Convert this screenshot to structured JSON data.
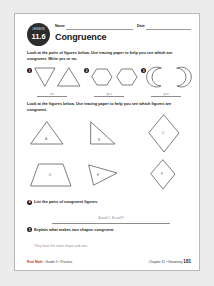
{
  "header": {
    "lesson_word": "LESSON",
    "lesson_number": "11.6",
    "name_label": "Name",
    "date_label": "Date",
    "title": "Congruence"
  },
  "instruction_1": {
    "lead": "Look",
    "rest": " at the pairs of figures below. Use tracing paper to help you see which are congruent. Write yes or no."
  },
  "problems": [
    {
      "number": "1",
      "answer": "no",
      "figures": [
        "triangle-down",
        "triangle-up"
      ]
    },
    {
      "number": "2",
      "answer": "yes",
      "figures": [
        "hexagon",
        "hexagon"
      ]
    },
    {
      "number": "3",
      "answer": "yes",
      "figures": [
        "arc-left",
        "arc-right"
      ]
    }
  ],
  "instruction_2": {
    "lead": "Look",
    "rest": " at the figures below. Use tracing paper to help you see which figures are congruent."
  },
  "figures": [
    {
      "label": "A",
      "shape": "triangle"
    },
    {
      "label": "B",
      "shape": "right-triangle"
    },
    {
      "label": "C",
      "shape": "rhombus-tall"
    },
    {
      "label": "D",
      "shape": "trapezoid"
    },
    {
      "label": "E",
      "shape": "triangle-rotated"
    },
    {
      "label": "F",
      "shape": "rhombus-small"
    }
  ],
  "questions": [
    {
      "number": "4",
      "text": "List the pairs of congruent figures.",
      "answer": "A and C, B and F"
    },
    {
      "number": "5",
      "text": "Explain what makes two shapes congruent.",
      "answer": "They have the same shape and size."
    }
  ],
  "footer": {
    "brand": "Real Math",
    "grade": "Grade 5",
    "section": "Practice",
    "chapter": "Chapter 11",
    "topic": "Geometry",
    "page": "181",
    "separator": "•"
  }
}
